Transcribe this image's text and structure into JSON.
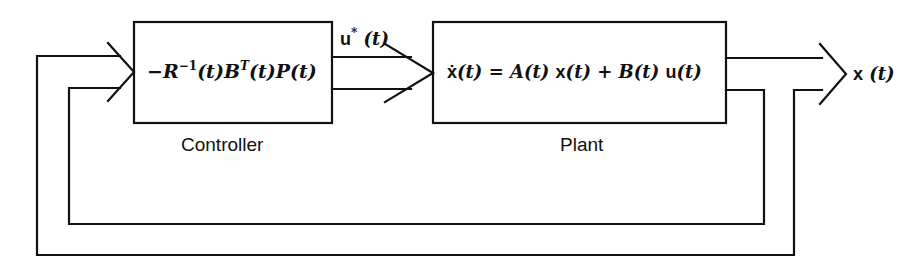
{
  "diagram": {
    "type": "block-diagram",
    "blocks": [
      {
        "id": "controller",
        "caption": "Controller",
        "expression": {
          "sign": "−",
          "R": "R",
          "R_sup": "−1",
          "arg1": "(t)",
          "B": "B",
          "B_sup": "T",
          "arg2": "(t)",
          "P": "P",
          "arg3": "(t)"
        }
      },
      {
        "id": "plant",
        "caption": "Plant",
        "expression": {
          "xdot": "ẋ",
          "arg1": "(t)",
          "eq": " = ",
          "A": "A",
          "arg2": "(t) ",
          "x": "x",
          "arg3": "(t)",
          "plus": " + ",
          "B": "B",
          "arg4": "(t) ",
          "u": "u",
          "arg5": "(t)"
        }
      }
    ],
    "signals": [
      {
        "id": "control-input",
        "name": "u",
        "sup": "*",
        "arg": " (t)",
        "from": "controller",
        "to": "plant"
      },
      {
        "id": "state-output",
        "name": "x",
        "arg": " (t)",
        "from": "plant",
        "to": "output"
      },
      {
        "id": "state-feedback",
        "from": "plant",
        "to": "controller"
      }
    ],
    "stroke_color": "#111111",
    "background": "#ffffff"
  }
}
